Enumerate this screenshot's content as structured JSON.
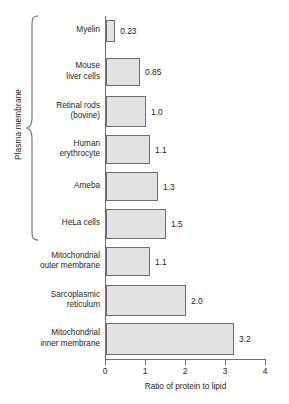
{
  "chart_data": {
    "type": "bar",
    "orientation": "horizontal",
    "title": "",
    "xlabel": "Ratio of protein to lipid",
    "ylabel": "",
    "xlim": [
      0,
      4
    ],
    "xticks": [
      0,
      1,
      2,
      3,
      4
    ],
    "xtick_labels": [
      "0",
      "1",
      "2",
      "3",
      "4"
    ],
    "grid": false,
    "legend": null,
    "categories": [
      "Myelin",
      "Mouse liver cells",
      "Retinal rods (bovine)",
      "Human erythrocyte",
      "Ameba",
      "HeLa cells",
      "Mitochondrial outer membrane",
      "Sarcoplasmic reticulum",
      "Mitochondrial inner membrane"
    ],
    "values": [
      0.23,
      0.85,
      1.0,
      1.1,
      1.3,
      1.5,
      1.1,
      2.0,
      3.2
    ],
    "value_labels": [
      "0.23",
      "0.85",
      "1.0",
      "1.1",
      "1.3",
      "1.5",
      "1.1",
      "2.0",
      "3.2"
    ],
    "annotations": [
      {
        "type": "group-bracket",
        "label": "Plasma membrane",
        "covers": [
          "Myelin",
          "Mouse liver cells",
          "Retinal rods (bovine)",
          "Human erythrocyte",
          "Ameba",
          "HeLa cells"
        ]
      }
    ],
    "colors": {
      "bar_fill": "#e2e2e2",
      "bar_stroke": "#6d6e71",
      "axis": "#6d6e71",
      "text": "#231f20",
      "background": "#ffffff"
    }
  },
  "rows": [
    {
      "label_lines": [
        "Myelin"
      ],
      "value": "0.23"
    },
    {
      "label_lines": [
        "Mouse",
        "liver cells"
      ],
      "value": "0.85"
    },
    {
      "label_lines": [
        "Retinal rods",
        "(bovine)"
      ],
      "value": "1.0"
    },
    {
      "label_lines": [
        "Human",
        "erythrocyte"
      ],
      "value": "1.1"
    },
    {
      "label_lines": [
        "Ameba"
      ],
      "value": "1.3"
    },
    {
      "label_lines": [
        "HeLa cells"
      ],
      "value": "1.5"
    },
    {
      "label_lines": [
        "Mitochondrial",
        "outer membrane"
      ],
      "value": "1.1"
    },
    {
      "label_lines": [
        "Sarcoplasmic",
        "reticulum"
      ],
      "value": "2.0"
    },
    {
      "label_lines": [
        "Mitochondrial",
        "inner membrane"
      ],
      "value": "3.2"
    }
  ],
  "group": {
    "label": "Plasma membrane"
  },
  "axis": {
    "title": "Ratio of protein to lipid",
    "ticks": [
      "0",
      "1",
      "2",
      "3",
      "4"
    ]
  }
}
